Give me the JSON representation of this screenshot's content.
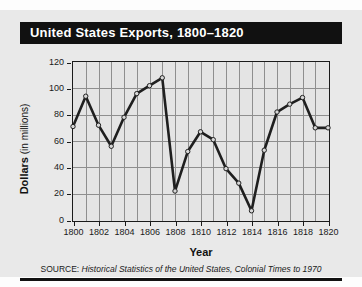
{
  "figure": {
    "title": "United States Exports, 1800–1820",
    "source_prefix": "SOURCE:",
    "source_text": " Historical Statistics of the United States, Colonial Times to 1970",
    "background_color": "#e9e9e9",
    "banner_color": "#111111",
    "title_color": "#ffffff",
    "line_color": "#1f1f1f",
    "marker_color": "#d8d8d8",
    "grid_color": "#8e8e8e"
  },
  "axes": {
    "y_label_bold": "Dollars",
    "y_label_rest": " (in millions)",
    "x_label": "Year",
    "y_ticks": [
      "120",
      "100",
      "80",
      "60",
      "40",
      "20",
      "0"
    ],
    "x_ticks": [
      "1800",
      "1802",
      "1804",
      "1806",
      "1808",
      "1810",
      "1812",
      "1814",
      "1816",
      "1818",
      "1820"
    ]
  },
  "chart_data": {
    "type": "line",
    "title": "United States Exports, 1800–1820",
    "xlabel": "Year",
    "ylabel": "Dollars (in millions)",
    "xlim": [
      1800,
      1820
    ],
    "ylim": [
      0,
      120
    ],
    "grid": true,
    "legend": "none",
    "x": [
      1800,
      1801,
      1802,
      1803,
      1804,
      1805,
      1806,
      1807,
      1808,
      1809,
      1810,
      1811,
      1812,
      1813,
      1814,
      1815,
      1816,
      1817,
      1818,
      1819,
      1820
    ],
    "values": [
      71,
      94,
      72,
      56,
      78,
      96,
      102,
      108,
      22,
      52,
      67,
      61,
      39,
      28,
      7,
      53,
      82,
      88,
      93,
      70,
      70
    ],
    "x_major_step": 2,
    "y_major_step": 20,
    "markers": "open-circle"
  }
}
